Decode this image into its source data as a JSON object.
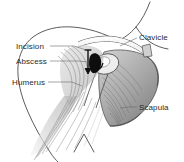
{
  "figure": {
    "background_color": "#ffffff",
    "ink_color": "#2b2b2b",
    "width": 184,
    "height": 162
  },
  "labels": [
    {
      "id": "incision",
      "text": "Incision",
      "x": 16,
      "y": 42,
      "side": "left",
      "leader_to_x": 90,
      "leader_to_y": 52
    },
    {
      "id": "abscess",
      "text": "Abscess",
      "x": 16,
      "y": 57,
      "side": "left",
      "leader_to_x": 94,
      "leader_to_y": 63
    },
    {
      "id": "humerus",
      "text": "Humerus",
      "x": 12,
      "y": 78,
      "side": "left",
      "leader_to_x": 82,
      "leader_to_y": 86
    },
    {
      "id": "clavicle",
      "text": "Clavicle",
      "x": 139,
      "y": 33,
      "side": "right",
      "leader_to_x": 118,
      "leader_to_y": 45
    },
    {
      "id": "scapula",
      "text": "Scapula",
      "x": 139,
      "y": 103,
      "side": "right",
      "leader_to_x": 120,
      "leader_to_y": 108
    }
  ],
  "markers": {
    "incision_arrow": {
      "type": "vertical-arrow",
      "x": 90,
      "y_top": 50,
      "y_bottom": 72,
      "color": "#101010"
    },
    "abscess_mass": {
      "type": "filled-dark-wedge",
      "x": 95,
      "y": 62,
      "color": "#0d0d0d"
    }
  },
  "anatomy": [
    {
      "id": "neck-outline",
      "kind": "skin-contour"
    },
    {
      "id": "clavicle-bone",
      "kind": "bone"
    },
    {
      "id": "scapula-bone",
      "kind": "bone"
    },
    {
      "id": "humerus-bone",
      "kind": "bone"
    },
    {
      "id": "deltoid-muscle",
      "kind": "muscle-fibers"
    },
    {
      "id": "infraspinatus-muscle",
      "kind": "muscle-fibers"
    },
    {
      "id": "arm-muscle",
      "kind": "muscle-fibers"
    }
  ]
}
